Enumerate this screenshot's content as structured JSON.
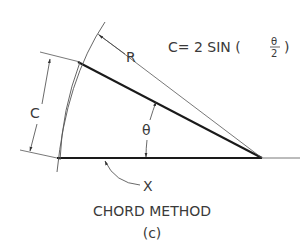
{
  "figure": {
    "formula": {
      "lhs": "C= 2 SIN (",
      "frac_num": "θ",
      "frac_den": "2",
      "rhs": ")"
    },
    "labels": {
      "radius": "R",
      "chord": "C",
      "angle": "θ",
      "baseline": "X"
    },
    "caption": "CHORD METHOD",
    "sublabel": "(c)"
  },
  "colors": {
    "ink": "#1a1a1a",
    "thin": "#555555",
    "text": "#3a3a3a",
    "background": "#ffffff"
  }
}
